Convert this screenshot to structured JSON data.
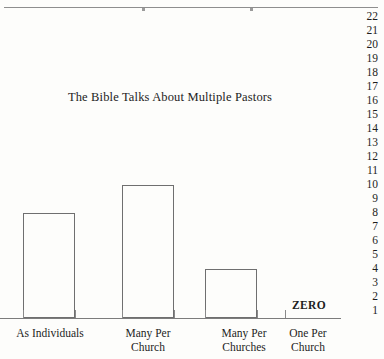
{
  "chart_data": {
    "type": "bar",
    "title": "The Bible Talks About Multiple Pastors",
    "xlabel": "",
    "ylabel": "",
    "categories": [
      "As Individuals",
      "Many Per\nChurch",
      "Many Per\nChurches",
      "One Per\nChurch"
    ],
    "values": [
      8,
      10,
      4,
      0
    ],
    "value_annotations": [
      "",
      "",
      "",
      "ZERO"
    ],
    "ylim": [
      0,
      22
    ],
    "ytick_labels": [
      "22",
      "21",
      "20",
      "19",
      "18",
      "17",
      "16",
      "15",
      "14",
      "13",
      "12",
      "11",
      "10",
      "9",
      "8",
      "7",
      "6",
      "5",
      "4",
      "3",
      "2",
      "1"
    ],
    "grid": false,
    "legend": null,
    "bar_style": "outline",
    "colors": {
      "background": "#fdfdfb",
      "bar_outline": "#6f6f6f",
      "axis": "#7c7c7c",
      "text": "#1d1d1d"
    }
  },
  "axis": {
    "tick_count": 7
  },
  "zero_marker": {
    "label": "ZERO"
  }
}
